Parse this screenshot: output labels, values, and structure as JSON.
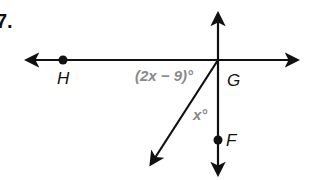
{
  "problem": {
    "number": "7."
  },
  "points": {
    "H": {
      "label": "H",
      "x": 63,
      "y": 60
    },
    "G": {
      "label": "G",
      "x": 218,
      "y": 60
    },
    "F": {
      "label": "F",
      "x": 218,
      "y": 140
    }
  },
  "angles": {
    "angle_HG_diag": {
      "label": "(2x − 9)°"
    },
    "angle_diag_GF": {
      "label": "x°"
    }
  },
  "colors": {
    "line": "#111111",
    "angle_label": "#8a8a8a",
    "point_label": "#111111"
  }
}
